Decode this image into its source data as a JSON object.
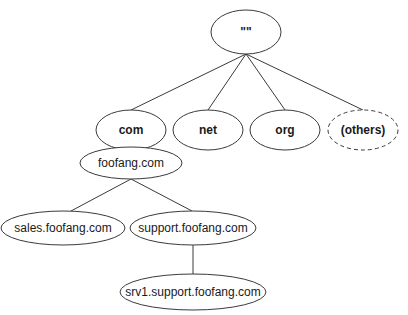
{
  "diagram": {
    "nodes": [
      {
        "id": "root",
        "label": "\"\"",
        "cx": 246,
        "cy": 32,
        "rx": 35,
        "ry": 22,
        "bold": true,
        "dashed": false
      },
      {
        "id": "com",
        "label": "com",
        "cx": 131,
        "cy": 130,
        "rx": 35,
        "ry": 20,
        "bold": true,
        "dashed": false
      },
      {
        "id": "net",
        "label": "net",
        "cx": 208,
        "cy": 130,
        "rx": 35,
        "ry": 20,
        "bold": true,
        "dashed": false
      },
      {
        "id": "org",
        "label": "org",
        "cx": 285,
        "cy": 130,
        "rx": 35,
        "ry": 20,
        "bold": true,
        "dashed": false
      },
      {
        "id": "others",
        "label": "(others)",
        "cx": 363,
        "cy": 130,
        "rx": 35,
        "ry": 20,
        "bold": true,
        "dashed": true
      },
      {
        "id": "foofang",
        "label": "foofang.com",
        "cx": 131,
        "cy": 163,
        "rx": 51,
        "ry": 16,
        "bold": false,
        "dashed": false
      },
      {
        "id": "sales",
        "label": "sales.foofang.com",
        "cx": 63,
        "cy": 228,
        "rx": 62,
        "ry": 17,
        "bold": false,
        "dashed": false
      },
      {
        "id": "support",
        "label": "support.foofang.com",
        "cx": 193,
        "cy": 228,
        "rx": 63,
        "ry": 17,
        "bold": false,
        "dashed": false
      },
      {
        "id": "srv1",
        "label": "srv1.support.foofang.com",
        "cx": 193,
        "cy": 292,
        "rx": 73,
        "ry": 18,
        "bold": false,
        "dashed": false
      }
    ],
    "edges": [
      {
        "from": "root",
        "to": "com",
        "x1": 246,
        "y1": 54,
        "x2": 131,
        "y2": 110
      },
      {
        "from": "root",
        "to": "net",
        "x1": 246,
        "y1": 54,
        "x2": 208,
        "y2": 110
      },
      {
        "from": "root",
        "to": "org",
        "x1": 246,
        "y1": 54,
        "x2": 285,
        "y2": 110
      },
      {
        "from": "root",
        "to": "others",
        "x1": 246,
        "y1": 54,
        "x2": 363,
        "y2": 110
      },
      {
        "from": "com",
        "to": "foofang",
        "x1": 131,
        "y1": 150,
        "x2": 131,
        "y2": 147
      },
      {
        "from": "foofang",
        "to": "sales",
        "x1": 131,
        "y1": 179,
        "x2": 71,
        "y2": 211
      },
      {
        "from": "foofang",
        "to": "support",
        "x1": 131,
        "y1": 179,
        "x2": 192,
        "y2": 211
      },
      {
        "from": "support",
        "to": "srv1",
        "x1": 193,
        "y1": 245,
        "x2": 193,
        "y2": 274
      }
    ]
  }
}
